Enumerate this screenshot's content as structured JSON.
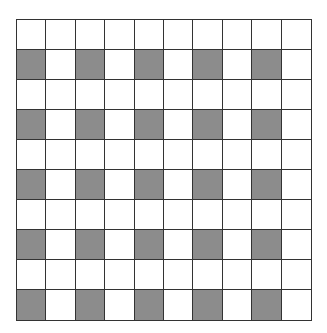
{
  "diagram": {
    "type": "grid",
    "rows": 10,
    "columns": 10,
    "shaded_color": "#8c8c8c",
    "empty_color": "#ffffff",
    "line_color": "#333333",
    "shaded_cells": [
      [
        2,
        1
      ],
      [
        2,
        3
      ],
      [
        2,
        5
      ],
      [
        2,
        7
      ],
      [
        2,
        9
      ],
      [
        4,
        1
      ],
      [
        4,
        3
      ],
      [
        4,
        5
      ],
      [
        4,
        7
      ],
      [
        4,
        9
      ],
      [
        6,
        1
      ],
      [
        6,
        3
      ],
      [
        6,
        5
      ],
      [
        6,
        7
      ],
      [
        6,
        9
      ],
      [
        8,
        1
      ],
      [
        8,
        3
      ],
      [
        8,
        5
      ],
      [
        8,
        7
      ],
      [
        8,
        9
      ],
      [
        10,
        1
      ],
      [
        10,
        3
      ],
      [
        10,
        5
      ],
      [
        10,
        7
      ],
      [
        10,
        9
      ]
    ],
    "shaded_count": 25,
    "total_cells": 100
  }
}
